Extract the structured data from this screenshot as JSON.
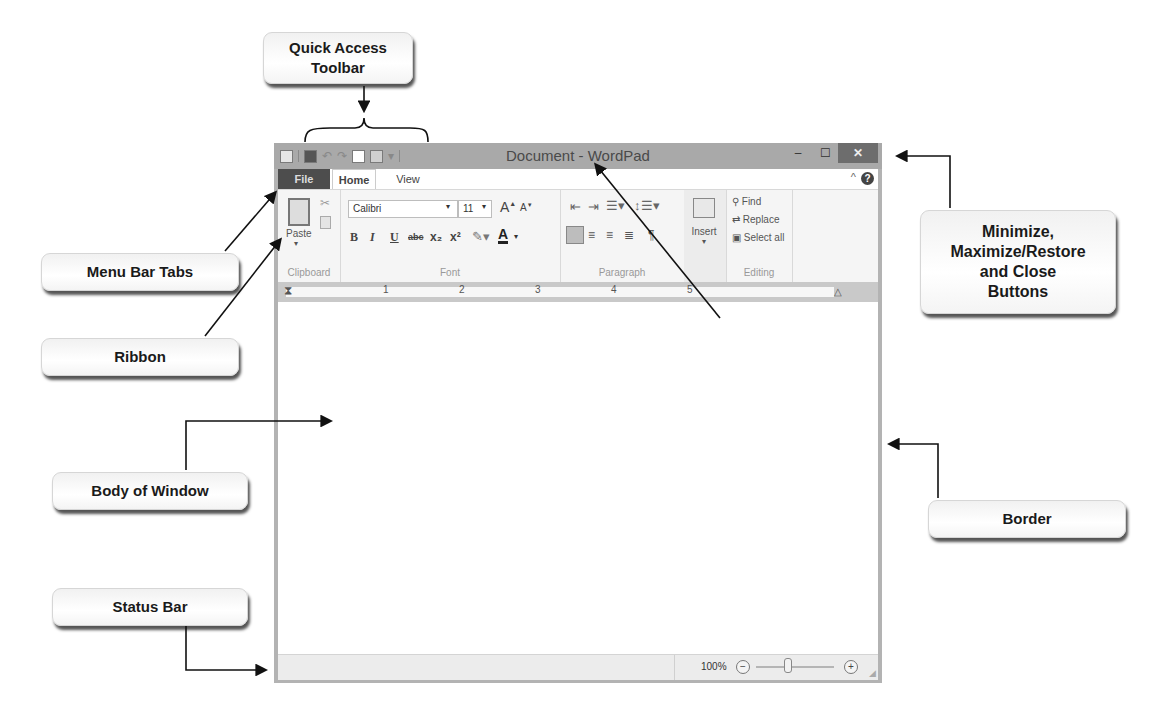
{
  "callouts": {
    "quick_access": {
      "line1": "Quick Access",
      "line2": "Toolbar"
    },
    "window_buttons": {
      "line1": "Minimize,",
      "line2": "Maximize/Restore",
      "line3": "and Close",
      "line4": "Buttons"
    },
    "menu_bar_tabs": "Menu Bar Tabs",
    "ribbon": "Ribbon",
    "title_bar": "Title Bar",
    "body_of_window": "Body  of Window",
    "border": "Border",
    "status_bar": "Status  Bar"
  },
  "window": {
    "title": "Document - WordPad",
    "controls": {
      "minimize": "‒",
      "maximize": "☐",
      "close": "✕"
    },
    "tabs": [
      {
        "label": "File"
      },
      {
        "label": "Home"
      },
      {
        "label": "View"
      }
    ],
    "ribbon": {
      "clipboard": {
        "paste_label": "Paste",
        "group_label": "Clipboard"
      },
      "font": {
        "font_name": "Calibri",
        "font_size": "11",
        "group_label": "Font",
        "buttons": [
          "B",
          "I",
          "U",
          "abc",
          "x₂",
          "x²"
        ]
      },
      "paragraph": {
        "group_label": "Paragraph"
      },
      "insert": {
        "label": "Insert"
      },
      "editing": {
        "find": "Find",
        "replace": "Replace",
        "select_all": "Select all",
        "group_label": "Editing"
      }
    },
    "ruler": {
      "marks": [
        "1",
        "2",
        "3",
        "4",
        "5"
      ]
    },
    "status": {
      "zoom_level": "100%",
      "zoom_out": "−",
      "zoom_in": "+"
    }
  },
  "colors": {
    "title_bar": "#a9a9a9",
    "file_tab": "#4d4d4d",
    "close_button": "#6d6d6d",
    "ribbon": "#f5f5f5"
  }
}
